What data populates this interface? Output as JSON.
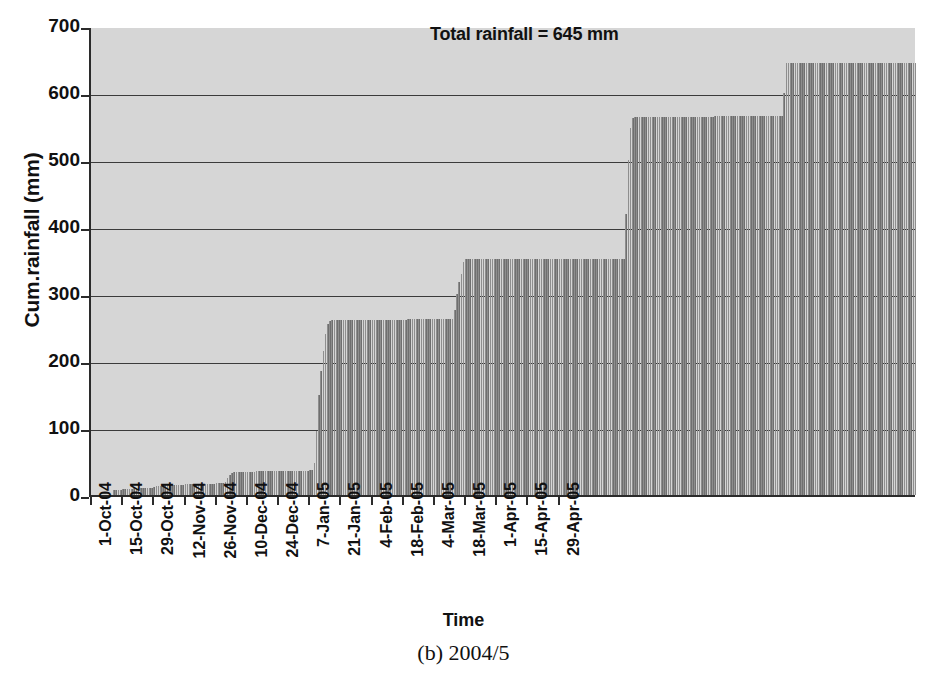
{
  "chart_data": {
    "type": "bar",
    "title": "",
    "annotation": "Total rainfall = 645 mm",
    "xlabel": "Time",
    "ylabel": "Cum.rainfall (mm)",
    "caption": "(b) 2004/5",
    "ylim": [
      0,
      700
    ],
    "ytick_values": [
      0,
      100,
      200,
      300,
      400,
      500,
      600,
      700
    ],
    "ytick_labels": [
      "0",
      "100",
      "200",
      "300",
      "400",
      "500",
      "600",
      "700"
    ],
    "grid": "horizontal",
    "legend": "none",
    "bar_color": "#6f6f6f",
    "plot_background": "#d6d6d6",
    "axis_color": "#2b2b2b",
    "xtick_labels": [
      "1-Oct-04",
      "15-Oct-04",
      "29-Oct-04",
      "12-Nov-04",
      "26-Nov-04",
      "10-Dec-04",
      "24-Dec-04",
      "7-Jan-05",
      "21-Jan-05",
      "4-Feb-05",
      "18-Feb-05",
      "4-Mar-05",
      "18-Mar-05",
      "1-Apr-05",
      "15-Apr-05",
      "29-Apr-05"
    ],
    "xtick_day_indices": [
      0,
      14,
      28,
      42,
      56,
      70,
      84,
      98,
      112,
      126,
      140,
      154,
      168,
      182,
      196,
      210
    ],
    "x_start": "1-Oct-04",
    "x_end": "29-Apr-05",
    "n_days": 211,
    "series_name": "Cumulative rainfall",
    "values": [
      0,
      0,
      0,
      0,
      0,
      0,
      0,
      0,
      0,
      0,
      8,
      8,
      8,
      8,
      9,
      9,
      9,
      9,
      9,
      10,
      10,
      10,
      10,
      10,
      11,
      11,
      11,
      11,
      12,
      14,
      14,
      14,
      14,
      15,
      15,
      15,
      15,
      15,
      15,
      15,
      15,
      15,
      16,
      16,
      16,
      16,
      16,
      16,
      16,
      17,
      17,
      17,
      17,
      17,
      17,
      17,
      18,
      18,
      18,
      18,
      19,
      25,
      30,
      33,
      34,
      34,
      34,
      34,
      35,
      35,
      35,
      35,
      35,
      35,
      36,
      36,
      36,
      36,
      36,
      36,
      36,
      36,
      36,
      36,
      36,
      36,
      36,
      36,
      36,
      36,
      36,
      36,
      36,
      36,
      36,
      36,
      36,
      36,
      37,
      37,
      48,
      95,
      150,
      185,
      215,
      240,
      255,
      260,
      261,
      261,
      261,
      261,
      261,
      261,
      261,
      261,
      261,
      261,
      261,
      261,
      261,
      261,
      261,
      261,
      261,
      261,
      261,
      261,
      261,
      261,
      261,
      261,
      261,
      261,
      261,
      261,
      261,
      261,
      261,
      261,
      261,
      261,
      262,
      262,
      262,
      262,
      262,
      262,
      262,
      262,
      262,
      262,
      262,
      262,
      263,
      263,
      263,
      263,
      263,
      263,
      263,
      263,
      263,
      276,
      300,
      318,
      330,
      348,
      352,
      352,
      352,
      352,
      352,
      352,
      352,
      352,
      352,
      352,
      352,
      352,
      352,
      352,
      352,
      352,
      352,
      352,
      352,
      352,
      352,
      352,
      352,
      352,
      352,
      352,
      352,
      352,
      352,
      352,
      352,
      352,
      352,
      352,
      352,
      352,
      352,
      352,
      352,
      352,
      353,
      353,
      353,
      353,
      353,
      353,
      353,
      353,
      353,
      353,
      353,
      353,
      353,
      353,
      353,
      353,
      353,
      353,
      353,
      353,
      353,
      353,
      353,
      353,
      353,
      353,
      353,
      353,
      353,
      353,
      353,
      353,
      420,
      500,
      548,
      562,
      564,
      564,
      564,
      564,
      564,
      564,
      564,
      564,
      564,
      564,
      564,
      564,
      564,
      564,
      564,
      564,
      564,
      564,
      564,
      564,
      564,
      564,
      564,
      564,
      564,
      564,
      564,
      564,
      564,
      564,
      564,
      564,
      564,
      564,
      564,
      564,
      565,
      565,
      565,
      565,
      565,
      565,
      565,
      565,
      565,
      565,
      565,
      565,
      565,
      565,
      565,
      565,
      565,
      565,
      565,
      565,
      565,
      565,
      565,
      565,
      565,
      565,
      565,
      565,
      565,
      565,
      565,
      600,
      645,
      645,
      645,
      645,
      645,
      645,
      645,
      645,
      645,
      645,
      645,
      645,
      645,
      645,
      645,
      645,
      645,
      645,
      645,
      645,
      645,
      645,
      645,
      645,
      645,
      645,
      645,
      645,
      645,
      645,
      645,
      645,
      645,
      645,
      645,
      645,
      645,
      645,
      645,
      645,
      645,
      645,
      645,
      645,
      645,
      645,
      645,
      645,
      645,
      645,
      645,
      645,
      645,
      645,
      645,
      645,
      645,
      645,
      645
    ]
  }
}
